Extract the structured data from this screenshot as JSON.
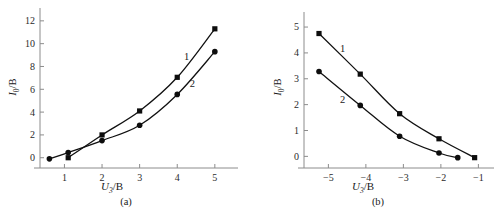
{
  "figure": {
    "panel_a_caption": "(a)",
    "panel_b_caption": "(b)"
  },
  "chart_data": [
    {
      "type": "line",
      "panel": "a",
      "title": "",
      "xlabel": "U3/B",
      "ylabel": "I0/B",
      "xlim": [
        0.35,
        5.35
      ],
      "ylim": [
        -0.9,
        12.6
      ],
      "xticks": [
        1,
        2,
        3,
        4,
        5
      ],
      "xtick_labels": [
        "1",
        "2",
        "3",
        "4",
        "5"
      ],
      "yticks": [
        0,
        2,
        4,
        6,
        8,
        10,
        12
      ],
      "ytick_labels": [
        "0",
        "2",
        "4",
        "6",
        "8",
        "10",
        "12"
      ],
      "grid": false,
      "legend": "inline-curve-numbers",
      "series": [
        {
          "name": "1",
          "marker": "square",
          "label_x": 4.25,
          "label_y": 8.6,
          "x": [
            1.1,
            2.0,
            3.0,
            4.0,
            5.0
          ],
          "values": [
            0.0,
            2.0,
            4.1,
            7.05,
            11.3
          ]
        },
        {
          "name": "2",
          "marker": "circle",
          "label_x": 4.4,
          "label_y": 6.2,
          "x": [
            0.6,
            1.1,
            2.0,
            3.0,
            4.0,
            5.0
          ],
          "values": [
            -0.1,
            0.45,
            1.5,
            2.85,
            5.55,
            9.3
          ]
        }
      ]
    },
    {
      "type": "line",
      "panel": "b",
      "title": "",
      "xlabel": "U3/B",
      "ylabel": "I0/B",
      "xlim": [
        -5.65,
        -0.85
      ],
      "ylim": [
        -0.45,
        5.35
      ],
      "xticks": [
        -5,
        -4,
        -3,
        -2,
        -1
      ],
      "xtick_labels": [
        "−5",
        "−4",
        "−3",
        "−2",
        "−1"
      ],
      "yticks": [
        0,
        1,
        2,
        3,
        4,
        5
      ],
      "ytick_labels": [
        "0",
        "1",
        "2",
        "3",
        "4",
        "5"
      ],
      "grid": false,
      "legend": "inline-curve-numbers",
      "series": [
        {
          "name": "1",
          "marker": "square",
          "label_x": -4.62,
          "label_y": 4.05,
          "x": [
            -5.25,
            -4.15,
            -3.1,
            -2.05,
            -1.1
          ],
          "values": [
            4.75,
            3.18,
            1.65,
            0.68,
            -0.05
          ]
        },
        {
          "name": "2",
          "marker": "circle",
          "label_x": -4.62,
          "label_y": 2.05,
          "x": [
            -5.25,
            -4.15,
            -3.1,
            -2.05,
            -1.55
          ],
          "values": [
            3.28,
            1.97,
            0.78,
            0.13,
            -0.05
          ]
        }
      ]
    }
  ]
}
